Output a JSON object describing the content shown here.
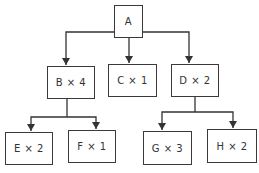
{
  "diagram": {
    "type": "tree",
    "nodes": {
      "a": {
        "label": "A"
      },
      "b": {
        "label": "B × 4"
      },
      "c": {
        "label": "C × 1"
      },
      "d": {
        "label": "D × 2"
      },
      "e": {
        "label": "E × 2"
      },
      "f": {
        "label": "F × 1"
      },
      "g": {
        "label": "G × 3"
      },
      "h": {
        "label": "H × 2"
      }
    },
    "edges": [
      {
        "from": "A",
        "to": "B"
      },
      {
        "from": "A",
        "to": "C"
      },
      {
        "from": "A",
        "to": "D"
      },
      {
        "from": "B",
        "to": "E"
      },
      {
        "from": "B",
        "to": "F"
      },
      {
        "from": "D",
        "to": "G"
      },
      {
        "from": "D",
        "to": "H"
      }
    ],
    "colors": {
      "line": "#333333",
      "box_border": "#3a3a3a",
      "text": "#333333"
    }
  }
}
